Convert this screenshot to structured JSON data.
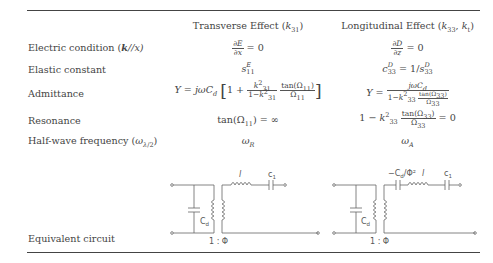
{
  "table": {
    "headers": {
      "col1": "Transverse Effect (k₃₁)",
      "col1_text": "Transverse Effect (",
      "col1_sym": "k",
      "col1_sub": "31",
      "col2_text": "Longitudinal Effect (",
      "col2_sym1": "k",
      "col2_sub1": "33",
      "col2_sym2": "k",
      "col2_sub2": "t"
    },
    "rows": [
      {
        "label": "Electric condition (k//x)",
        "label_text": "Electric condition (",
        "label_bold": "k",
        "label_tail": "//x)",
        "transverse": "∂E/∂x = 0",
        "longitudinal": "∂D/∂z = 0"
      },
      {
        "label": "Elastic constant",
        "transverse": "s^E_11",
        "longitudinal": "c^D_33 = 1/s^D_33"
      },
      {
        "label": "Admittance",
        "transverse": "Y = jωC_d [1 + k²_31/(1−k²_31) · tan(Ω_11)/Ω_11]",
        "longitudinal": "Y = jωC_d / (1 − k²_33 · tan(Ω_33)/Ω_33)"
      },
      {
        "label": "Resonance",
        "transverse": "tan(Ω_11) = ∞",
        "longitudinal": "1 − k²_33 · tan(Ω_33)/Ω_33 = 0"
      },
      {
        "label": "Half-wave frequency (ω_λ/2)",
        "label_text": "Half-wave frequency (",
        "transverse": "ω_R",
        "longitudinal": "ω_A"
      },
      {
        "label": "Equivalent circuit",
        "transverse": "circuit: Cd shunt, 1:Φ transformer, l series, c1 series",
        "longitudinal": "circuit: Cd shunt, 1:Φ transformer, −Cd/Φ² series, l series, c1 series"
      }
    ],
    "circuit_labels": {
      "cd": "C",
      "cd_sub": "d",
      "l": "l",
      "c1": "c",
      "c1_sub": "1",
      "ratio": "1 : Φ",
      "neg_cd": "−C",
      "neg_cd_tail": "/Φ²"
    }
  }
}
